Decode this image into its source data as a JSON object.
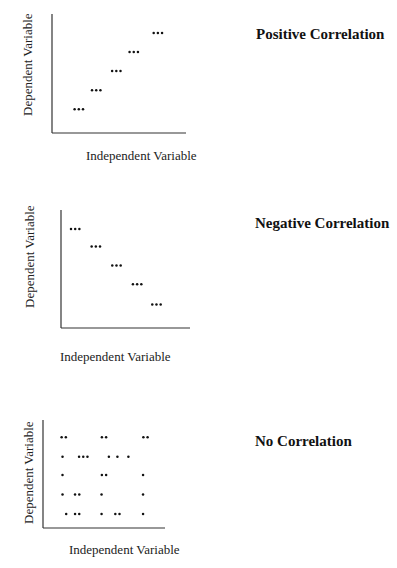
{
  "chart_data": [
    {
      "type": "scatter",
      "title": "Positive Correlation",
      "xlabel": "Independent Variable",
      "ylabel": "Dependent Variable",
      "xlim": [
        0,
        10
      ],
      "ylim": [
        0,
        10
      ],
      "grid": false,
      "points": [
        {
          "x": 2.0,
          "y": 2.0,
          "marker": "•••"
        },
        {
          "x": 3.3,
          "y": 3.6,
          "marker": "•••"
        },
        {
          "x": 4.8,
          "y": 5.2,
          "marker": "•••"
        },
        {
          "x": 6.1,
          "y": 6.8,
          "marker": "•••"
        },
        {
          "x": 7.9,
          "y": 8.4,
          "marker": "•••"
        }
      ]
    },
    {
      "type": "scatter",
      "title": "Negative Correlation",
      "xlabel": "Independent Variable",
      "ylabel": "Dependent Variable",
      "xlim": [
        0,
        10
      ],
      "ylim": [
        0,
        10
      ],
      "grid": false,
      "points": [
        {
          "x": 1.1,
          "y": 8.4,
          "marker": "•••"
        },
        {
          "x": 2.7,
          "y": 6.9,
          "marker": "•••"
        },
        {
          "x": 4.3,
          "y": 5.3,
          "marker": "•••"
        },
        {
          "x": 5.9,
          "y": 3.7,
          "marker": "•••"
        },
        {
          "x": 7.4,
          "y": 2.0,
          "marker": "•••"
        }
      ]
    },
    {
      "type": "scatter",
      "title": "No Correlation",
      "xlabel": "Independent Variable",
      "ylabel": "Dependent Variable",
      "xlim": [
        0,
        10
      ],
      "ylim": [
        0,
        10
      ],
      "grid": false,
      "points": [
        {
          "x": 1.7,
          "y": 8.4,
          "marker": "••"
        },
        {
          "x": 5.0,
          "y": 8.4,
          "marker": "••"
        },
        {
          "x": 8.4,
          "y": 8.4,
          "marker": "••"
        },
        {
          "x": 1.6,
          "y": 6.6,
          "marker": "•"
        },
        {
          "x": 3.3,
          "y": 6.6,
          "marker": "•••"
        },
        {
          "x": 5.4,
          "y": 6.6,
          "marker": "•"
        },
        {
          "x": 6.1,
          "y": 6.6,
          "marker": "•"
        },
        {
          "x": 7.0,
          "y": 6.6,
          "marker": "•"
        },
        {
          "x": 1.6,
          "y": 4.9,
          "marker": "•"
        },
        {
          "x": 5.0,
          "y": 4.9,
          "marker": "••"
        },
        {
          "x": 8.2,
          "y": 4.9,
          "marker": "•"
        },
        {
          "x": 1.6,
          "y": 3.1,
          "marker": "•"
        },
        {
          "x": 2.8,
          "y": 3.1,
          "marker": "••"
        },
        {
          "x": 4.8,
          "y": 3.1,
          "marker": "•"
        },
        {
          "x": 8.2,
          "y": 3.1,
          "marker": "•"
        },
        {
          "x": 1.9,
          "y": 1.3,
          "marker": "•"
        },
        {
          "x": 2.8,
          "y": 1.3,
          "marker": "••"
        },
        {
          "x": 4.8,
          "y": 1.3,
          "marker": "•"
        },
        {
          "x": 6.1,
          "y": 1.3,
          "marker": "••"
        },
        {
          "x": 8.2,
          "y": 1.3,
          "marker": "•"
        }
      ]
    }
  ]
}
